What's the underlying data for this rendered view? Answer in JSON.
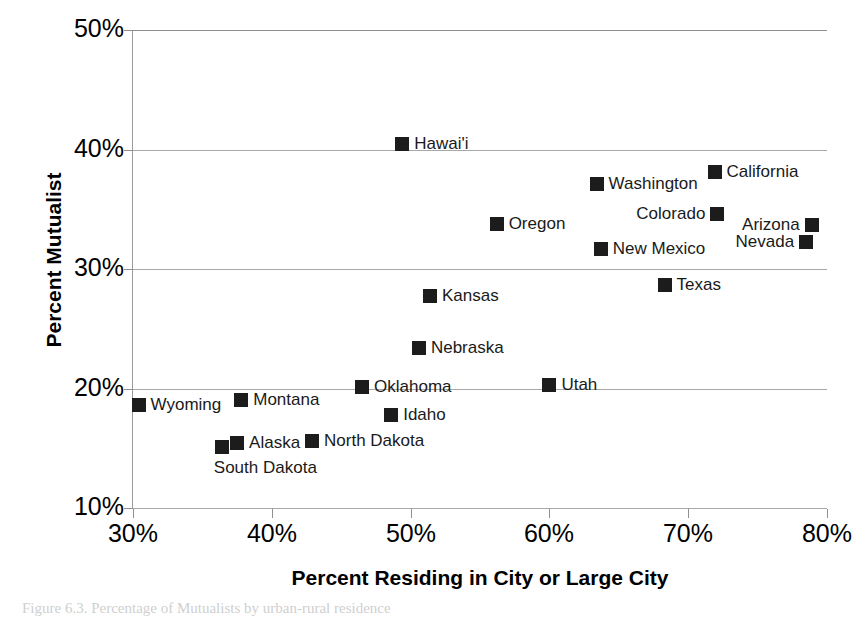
{
  "chart_data": {
    "type": "scatter",
    "title": "",
    "xlabel": "Percent Residing in City or Large City",
    "ylabel": "Percent Mutualist",
    "xlim": [
      30,
      80
    ],
    "ylim": [
      10,
      50
    ],
    "xticks": [
      "30%",
      "40%",
      "50%",
      "60%",
      "70%",
      "80%"
    ],
    "xtick_values": [
      30,
      40,
      50,
      60,
      70,
      80
    ],
    "yticks": [
      "10%",
      "20%",
      "30%",
      "40%",
      "50%"
    ],
    "ytick_values": [
      10,
      20,
      30,
      40,
      50
    ],
    "grid": "horizontal",
    "legend": "none",
    "marker": "filled-square",
    "marker_color": "#1c1c1c",
    "points": [
      {
        "label": "Wyoming",
        "x": 30.4,
        "y": 18.6,
        "label_pos": "right"
      },
      {
        "label": "Alaska",
        "x": 37.5,
        "y": 15.4,
        "label_pos": "right"
      },
      {
        "label": "South Dakota",
        "x": 36.4,
        "y": 15.1,
        "label_pos": "below"
      },
      {
        "label": "Montana",
        "x": 37.8,
        "y": 19.0,
        "label_pos": "right"
      },
      {
        "label": "North Dakota",
        "x": 42.9,
        "y": 15.6,
        "label_pos": "right"
      },
      {
        "label": "Oklahoma",
        "x": 46.5,
        "y": 20.1,
        "label_pos": "right"
      },
      {
        "label": "Idaho",
        "x": 48.6,
        "y": 17.8,
        "label_pos": "right"
      },
      {
        "label": "Hawai'i",
        "x": 49.4,
        "y": 40.5,
        "label_pos": "right"
      },
      {
        "label": "Kansas",
        "x": 51.4,
        "y": 27.7,
        "label_pos": "right"
      },
      {
        "label": "Nebraska",
        "x": 50.6,
        "y": 23.4,
        "label_pos": "right"
      },
      {
        "label": "Oregon",
        "x": 56.2,
        "y": 33.8,
        "label_pos": "right"
      },
      {
        "label": "Utah",
        "x": 60.0,
        "y": 20.3,
        "label_pos": "right"
      },
      {
        "label": "Washington",
        "x": 63.4,
        "y": 37.1,
        "label_pos": "right"
      },
      {
        "label": "New Mexico",
        "x": 63.7,
        "y": 31.7,
        "label_pos": "right"
      },
      {
        "label": "Texas",
        "x": 68.3,
        "y": 28.7,
        "label_pos": "right"
      },
      {
        "label": "Colorado",
        "x": 72.1,
        "y": 34.6,
        "label_pos": "left"
      },
      {
        "label": "California",
        "x": 71.9,
        "y": 38.1,
        "label_pos": "right"
      },
      {
        "label": "Arizona",
        "x": 78.9,
        "y": 33.7,
        "label_pos": "left"
      },
      {
        "label": "Nevada",
        "x": 78.5,
        "y": 32.3,
        "label_pos": "left"
      }
    ]
  },
  "caption": {
    "text": "Figure 6.3. Percentage of Mutualists by urban-rural residence"
  }
}
